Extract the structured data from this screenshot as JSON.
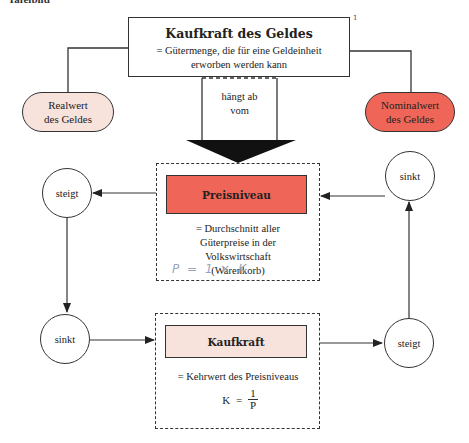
{
  "page_label": "Tafelbild",
  "footnote_mark": "1",
  "top_box": {
    "title": "Kaufkraft des Geldes",
    "definition_line1": "= Gütermenge, die für eine Geldeinheit",
    "definition_line2": "erworben werden kann"
  },
  "left_pill": {
    "line1": "Realwert",
    "line2": "des Geldes",
    "color": "#f8e2dc"
  },
  "right_pill": {
    "line1": "Nominalwert",
    "line2": "des Geldes",
    "color": "#ef6658"
  },
  "arrow_label": {
    "line1": "hängt ab",
    "line2": "vom"
  },
  "preisniveau_box": {
    "title": "Preisniveau",
    "color": "#ef6658",
    "desc_lines": [
      "= Durchschnitt aller",
      "Güterpreise in der",
      "Volkswirtschaft",
      "(Warenkorb)"
    ],
    "handwritten_note": "P = 1 × K"
  },
  "kaufkraft_box": {
    "title": "Kaufkraft",
    "color": "#f8e2dc",
    "desc": "= Kehrwert des Preisniveaus",
    "formula_lhs": "K",
    "formula_eq": "=",
    "formula_num": "1",
    "formula_den": "P"
  },
  "circles": {
    "top_left": "steigt",
    "bottom_left": "sinkt",
    "top_right": "sinkt",
    "bottom_right": "steigt"
  }
}
